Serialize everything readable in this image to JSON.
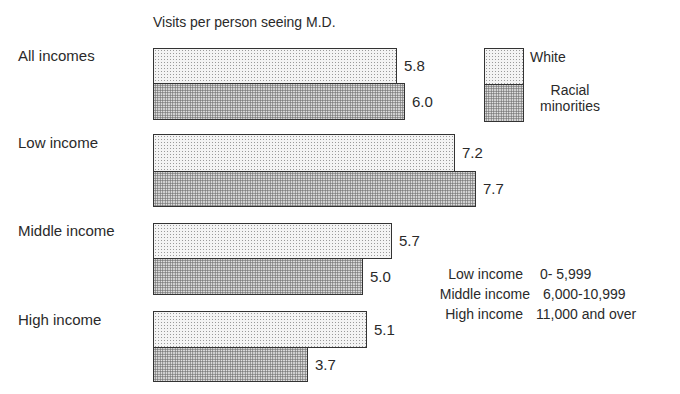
{
  "chart_data": {
    "type": "bar",
    "orientation": "horizontal",
    "title": "Visits per person seeing M.D.",
    "xlabel": "",
    "ylabel": "",
    "grid": false,
    "legend_position": "upper right",
    "categories": [
      "All incomes",
      "Low income",
      "Middle income",
      "High income"
    ],
    "series": [
      {
        "name": "White",
        "values": [
          5.8,
          7.2,
          5.7,
          5.1
        ]
      },
      {
        "name": "Racial minorities",
        "values": [
          6.0,
          7.7,
          5.0,
          3.7
        ]
      }
    ],
    "value_labels": [
      [
        "5.8",
        "6.0"
      ],
      [
        "7.2",
        "7.7"
      ],
      [
        "5.7",
        "5.0"
      ],
      [
        "5.1",
        "3.7"
      ]
    ],
    "annotations": {
      "income_key": [
        {
          "label": "Low income",
          "range": "0- 5,999"
        },
        {
          "label": "Middle income",
          "range": "6,000-10,999"
        },
        {
          "label": "High income",
          "range": "11,000 and over"
        }
      ]
    }
  },
  "legend": {
    "white": "White",
    "minority_line1": "Racial",
    "minority_line2": "minorities"
  }
}
